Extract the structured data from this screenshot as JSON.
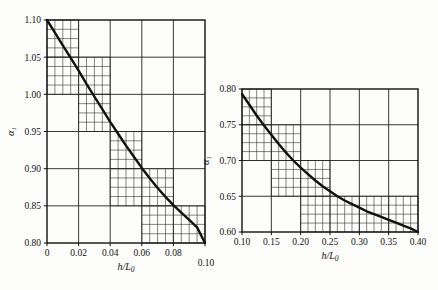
{
  "figure": {
    "background_color": "#fdfdfb",
    "ink_color": "#111111",
    "grid_color": "#222222"
  },
  "chart_data": [
    {
      "id": "left-chart",
      "type": "line",
      "title": "",
      "xlabel": "h/L0",
      "xlabel_display": "h/L",
      "xlabel_sub": "0",
      "ylabel": "alpha_1",
      "ylabel_display": "α",
      "ylabel_sub": "1",
      "xlim": [
        0,
        0.1
      ],
      "ylim": [
        0.8,
        1.1
      ],
      "xticks": [
        0,
        0.02,
        0.04,
        0.06,
        0.08,
        0.1
      ],
      "xtick_labels": [
        "0",
        "0.02",
        "0.04",
        "0.06",
        "0.08",
        "0.10"
      ],
      "yticks": [
        0.8,
        0.85,
        0.9,
        0.95,
        1.0,
        1.05,
        1.1
      ],
      "ytick_labels": [
        "0.80",
        "0.85",
        "0.90",
        "0.95",
        "1.00",
        "1.05",
        "1.10"
      ],
      "minor_x_step": 0.005,
      "minor_y_step": 0.0125,
      "grid": true,
      "legend": "none",
      "x": [
        0,
        0.005,
        0.01,
        0.015,
        0.02,
        0.025,
        0.03,
        0.035,
        0.04,
        0.045,
        0.05,
        0.055,
        0.06,
        0.065,
        0.07,
        0.075,
        0.08,
        0.085,
        0.09,
        0.095,
        0.1
      ],
      "y": [
        1.1,
        1.083,
        1.066,
        1.049,
        1.032,
        1.014,
        0.997,
        0.98,
        0.963,
        0.947,
        0.931,
        0.916,
        0.901,
        0.887,
        0.874,
        0.862,
        0.851,
        0.841,
        0.831,
        0.821,
        0.8
      ],
      "staircase_blocks": [
        {
          "x0": 0.0,
          "x1": 0.02,
          "y0": 1.05,
          "y1": 1.1
        },
        {
          "x0": 0.0,
          "x1": 0.04,
          "y0": 1.0,
          "y1": 1.05
        },
        {
          "x0": 0.02,
          "x1": 0.04,
          "y0": 0.95,
          "y1": 1.0
        },
        {
          "x0": 0.04,
          "x1": 0.06,
          "y0": 0.9,
          "y1": 0.95
        },
        {
          "x0": 0.04,
          "x1": 0.08,
          "y0": 0.85,
          "y1": 0.9
        },
        {
          "x0": 0.06,
          "x1": 0.1,
          "y0": 0.8,
          "y1": 0.85
        }
      ]
    },
    {
      "id": "right-chart",
      "type": "line",
      "title": "",
      "xlabel": "h/L0",
      "xlabel_display": "h/L",
      "xlabel_sub": "0",
      "ylabel": "alpha_1",
      "ylabel_display": "α",
      "ylabel_sub": "1",
      "xlim": [
        0.1,
        0.4
      ],
      "ylim": [
        0.6,
        0.8
      ],
      "xticks": [
        0.1,
        0.15,
        0.2,
        0.25,
        0.3,
        0.35,
        0.4
      ],
      "xtick_labels": [
        "0.10",
        "0.15",
        "0.20",
        "0.25",
        "0.30",
        "0.35",
        "0.40"
      ],
      "yticks": [
        0.6,
        0.65,
        0.7,
        0.75,
        0.8
      ],
      "ytick_labels": [
        "0.60",
        "0.65",
        "0.70",
        "0.75",
        "0.80"
      ],
      "minor_x_step": 0.0125,
      "minor_y_step": 0.0125,
      "grid": true,
      "legend": "none",
      "x": [
        0.1,
        0.1125,
        0.125,
        0.1375,
        0.15,
        0.1625,
        0.175,
        0.1875,
        0.2,
        0.2125,
        0.225,
        0.2375,
        0.25,
        0.2625,
        0.275,
        0.2875,
        0.3,
        0.3125,
        0.325,
        0.3375,
        0.35,
        0.3625,
        0.375,
        0.3875,
        0.4
      ],
      "y": [
        0.793,
        0.778,
        0.763,
        0.749,
        0.736,
        0.723,
        0.711,
        0.7,
        0.69,
        0.681,
        0.672,
        0.664,
        0.657,
        0.65,
        0.644,
        0.639,
        0.634,
        0.629,
        0.625,
        0.621,
        0.617,
        0.613,
        0.609,
        0.605,
        0.6
      ],
      "staircase_blocks": [
        {
          "x0": 0.1,
          "x1": 0.15,
          "y0": 0.75,
          "y1": 0.8
        },
        {
          "x0": 0.1,
          "x1": 0.2,
          "y0": 0.7,
          "y1": 0.75
        },
        {
          "x0": 0.15,
          "x1": 0.25,
          "y0": 0.65,
          "y1": 0.7
        },
        {
          "x0": 0.2,
          "x1": 0.4,
          "y0": 0.6,
          "y1": 0.65
        }
      ]
    }
  ]
}
